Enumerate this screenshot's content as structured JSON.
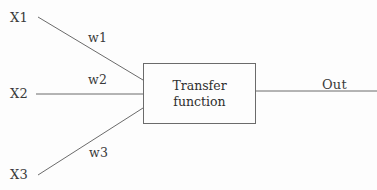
{
  "diagram": {
    "background_color": "#fdfdfd",
    "stroke_color": "#6b6b6b",
    "text_color": "#3a3a3a",
    "inputs": [
      {
        "label": "X1",
        "weight_label": "w1"
      },
      {
        "label": "X2",
        "weight_label": "w2"
      },
      {
        "label": "X3",
        "weight_label": "w3"
      }
    ],
    "processor": {
      "line1": "Transfer",
      "line2": "function"
    },
    "output": {
      "label": "Out"
    }
  }
}
